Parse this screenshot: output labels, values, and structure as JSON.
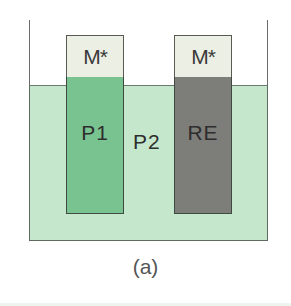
{
  "figure": {
    "caption": "(a)",
    "electrodes": [
      {
        "id": "P1",
        "cap_label": "M*",
        "body_label": "P1",
        "body_color": "#79c390"
      },
      {
        "id": "RE",
        "cap_label": "M*",
        "body_label": "RE",
        "body_color": "#7d7d7a"
      }
    ],
    "solution_label": "P2",
    "colors": {
      "solution": "#c5e8cd",
      "cap": "#ecefe3",
      "wall": "#6b6b6b"
    }
  }
}
